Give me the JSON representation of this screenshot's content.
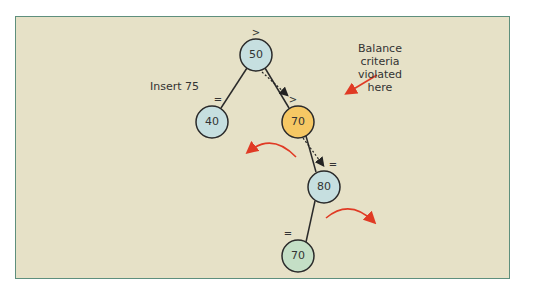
{
  "diagram": {
    "annotations": {
      "insert": "Insert 75",
      "violation": [
        "Balance",
        "criteria",
        "violated",
        "here"
      ]
    },
    "nodes": [
      {
        "id": "n50",
        "value": "50",
        "balance": ">",
        "fill": "#c6dfe0"
      },
      {
        "id": "n40",
        "value": "40",
        "balance": "=",
        "fill": "#c6dfe0"
      },
      {
        "id": "n70a",
        "value": "70",
        "balance": ">",
        "fill": "#f6c864"
      },
      {
        "id": "n80",
        "value": "80",
        "balance": "=",
        "fill": "#c6dfe0"
      },
      {
        "id": "n70b",
        "value": "70",
        "balance": "=",
        "fill": "#c4dfc6"
      }
    ],
    "colors": {
      "background": "#e6e1c7",
      "border": "#5e8f7d",
      "arrow": "#e03a24",
      "edge": "#2a2a2a"
    }
  }
}
